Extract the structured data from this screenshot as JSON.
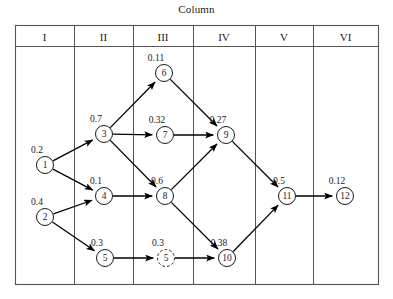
{
  "figure": {
    "caption": "Column",
    "columns": [
      {
        "label": "I",
        "x1": 15,
        "x2": 74
      },
      {
        "label": "II",
        "x1": 74,
        "x2": 133
      },
      {
        "label": "III",
        "x1": 133,
        "x2": 193
      },
      {
        "label": "IV",
        "x1": 193,
        "x2": 255
      },
      {
        "label": "V",
        "x1": 255,
        "x2": 313
      },
      {
        "label": "VI",
        "x1": 313,
        "x2": 378
      }
    ],
    "frame": {
      "x": 15,
      "y": 25,
      "width": 363,
      "height": 259,
      "header_bottom_y": 46
    },
    "nodes": [
      {
        "id": "1",
        "label": "1",
        "weight": "0.2",
        "column": "I",
        "cx": 45,
        "cy": 165,
        "r": 8.5,
        "dashed": false
      },
      {
        "id": "2",
        "label": "2",
        "weight": "0.4",
        "column": "I",
        "cx": 45,
        "cy": 217,
        "r": 8.5,
        "dashed": false
      },
      {
        "id": "3",
        "label": "3",
        "weight": "0.7",
        "column": "II",
        "cx": 104,
        "cy": 134,
        "r": 8.5,
        "dashed": false
      },
      {
        "id": "4",
        "label": "4",
        "weight": "0.1",
        "column": "II",
        "cx": 104,
        "cy": 196,
        "r": 8.5,
        "dashed": false
      },
      {
        "id": "5",
        "label": "5",
        "weight": "0.3",
        "column": "II",
        "cx": 105,
        "cy": 258,
        "r": 8.5,
        "dashed": false
      },
      {
        "id": "6",
        "label": "6",
        "weight": "0.11",
        "column": "III",
        "cx": 164,
        "cy": 73,
        "r": 8.5,
        "dashed": false
      },
      {
        "id": "7",
        "label": "7",
        "weight": "0.32",
        "column": "III",
        "cx": 165,
        "cy": 135,
        "r": 8.5,
        "dashed": false
      },
      {
        "id": "8",
        "label": "8",
        "weight": "0.6",
        "column": "III",
        "cx": 165,
        "cy": 196,
        "r": 8.5,
        "dashed": false
      },
      {
        "id": "5p",
        "label": "5",
        "weight": "0.3",
        "column": "III",
        "cx": 166,
        "cy": 258,
        "r": 8.5,
        "dashed": true
      },
      {
        "id": "9",
        "label": "9",
        "weight": "0.27",
        "column": "IV",
        "cx": 226,
        "cy": 135,
        "r": 8.5,
        "dashed": false
      },
      {
        "id": "10",
        "label": "10",
        "weight": "0.38",
        "column": "IV",
        "cx": 227,
        "cy": 258,
        "r": 8.5,
        "dashed": false
      },
      {
        "id": "11",
        "label": "11",
        "weight": "0.5",
        "column": "V",
        "cx": 287,
        "cy": 196,
        "r": 8.5,
        "dashed": false
      },
      {
        "id": "12",
        "label": "12",
        "weight": "0.12",
        "column": "VI",
        "cx": 345,
        "cy": 196,
        "r": 8.5,
        "dashed": false
      }
    ],
    "edges": [
      {
        "from": "1",
        "to": "3"
      },
      {
        "from": "1",
        "to": "4"
      },
      {
        "from": "2",
        "to": "4"
      },
      {
        "from": "2",
        "to": "5"
      },
      {
        "from": "3",
        "to": "6"
      },
      {
        "from": "3",
        "to": "7"
      },
      {
        "from": "3",
        "to": "8"
      },
      {
        "from": "4",
        "to": "8"
      },
      {
        "from": "5",
        "to": "5p"
      },
      {
        "from": "6",
        "to": "9"
      },
      {
        "from": "7",
        "to": "9"
      },
      {
        "from": "8",
        "to": "9"
      },
      {
        "from": "8",
        "to": "10"
      },
      {
        "from": "5p",
        "to": "10"
      },
      {
        "from": "9",
        "to": "11"
      },
      {
        "from": "10",
        "to": "11"
      },
      {
        "from": "11",
        "to": "12"
      }
    ]
  }
}
